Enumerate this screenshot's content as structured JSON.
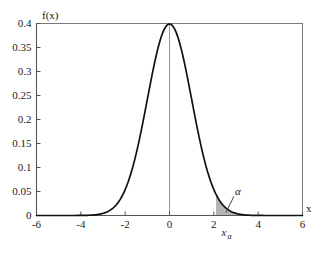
{
  "chart_data": {
    "type": "line",
    "title": "",
    "xlabel": "x",
    "ylabel": "f(x)",
    "xlim": [
      -6,
      6
    ],
    "ylim": [
      0,
      0.4
    ],
    "grid": false,
    "legend": "none",
    "xticks": [
      -6,
      -4,
      -2,
      0,
      2,
      4,
      6
    ],
    "xtick_labels": [
      "-6",
      "-4",
      "-2",
      "0",
      "2",
      "4",
      "6"
    ],
    "yticks": [
      0,
      0.05,
      0.1,
      0.15,
      0.2,
      0.25,
      0.3,
      0.35,
      0.4
    ],
    "ytick_labels": [
      "0",
      "0.05",
      "0.1",
      "0.15",
      "0.2",
      "0.25",
      "0.3",
      "0.35",
      "0.4"
    ],
    "series": [
      {
        "name": "standard normal density",
        "x": [
          -6,
          -5.75,
          -5.5,
          -5.25,
          -5,
          -4.75,
          -4.5,
          -4.25,
          -4,
          -3.75,
          -3.5,
          -3.25,
          -3,
          -2.75,
          -2.5,
          -2.25,
          -2,
          -1.75,
          -1.5,
          -1.25,
          -1,
          -0.75,
          -0.5,
          -0.25,
          0,
          0.25,
          0.5,
          0.75,
          1,
          1.25,
          1.5,
          1.75,
          2,
          2.25,
          2.5,
          2.75,
          3,
          3.25,
          3.5,
          3.75,
          4,
          4.25,
          4.5,
          4.75,
          5,
          5.25,
          5.5,
          5.75,
          6
        ],
        "y": [
          0.0,
          0.0,
          0.0,
          0.0,
          0.0,
          0.0,
          0.0,
          0.0001,
          0.0001,
          0.0004,
          0.0009,
          0.002,
          0.0044,
          0.0091,
          0.0175,
          0.0317,
          0.054,
          0.0863,
          0.1295,
          0.1826,
          0.242,
          0.3011,
          0.3521,
          0.3867,
          0.3989,
          0.3867,
          0.3521,
          0.3011,
          0.242,
          0.1826,
          0.1295,
          0.0863,
          0.054,
          0.0317,
          0.0175,
          0.0091,
          0.0044,
          0.002,
          0.0009,
          0.0004,
          0.0001,
          0.0001,
          0.0,
          0.0,
          0.0,
          0.0,
          0.0,
          0.0,
          0.0
        ]
      }
    ],
    "shaded_region": {
      "label": "α",
      "x_start": 2.1,
      "x_end": 6,
      "color": "#b0b0b0"
    },
    "annotations": [
      {
        "name": "alpha",
        "text": "α",
        "x": 2.95,
        "y": 0.042
      },
      {
        "name": "x-alpha",
        "text": "x",
        "subscript": "α",
        "x": 2.35,
        "y": -0.018
      }
    ],
    "peak_value": 0.3989,
    "mean": 0,
    "std_dev": 1
  },
  "labels": {
    "y_axis_name": "f(x)",
    "x_axis_name": "x",
    "alpha_symbol": "α",
    "x_alpha_base": "x",
    "x_alpha_sub": "α"
  },
  "colors": {
    "curve": "#111111",
    "frame": "#7a7a7a",
    "axis": "#555555",
    "center_line": "#8a8a8a",
    "shade": "#b0b0b0",
    "text": "#1a1a1a",
    "background": "#ffffff"
  }
}
